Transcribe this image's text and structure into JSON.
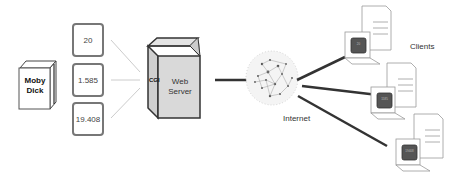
{
  "book": {
    "title_line1": "Moby",
    "title_line2": "Dick"
  },
  "values": [
    "20",
    "1.585",
    "19.408"
  ],
  "server": {
    "cgi_label": "CGI",
    "label_line1": "Web",
    "label_line2": "Server"
  },
  "network": {
    "label": "Internet"
  },
  "clients": {
    "label": "Clients",
    "screens": [
      "20",
      "1585",
      "19408"
    ]
  }
}
